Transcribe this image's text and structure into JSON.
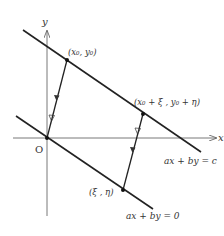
{
  "diagram": {
    "type": "geometry",
    "colors": {
      "line": "#222222",
      "axis": "#555555",
      "text": "#333333",
      "background": "#ffffff"
    },
    "axes": {
      "x_label": "x",
      "y_label": "y",
      "origin_label": "O"
    },
    "lines": [
      {
        "id": "upper",
        "equation": "ax + by = c"
      },
      {
        "id": "lower",
        "equation": "ax + by = 0"
      }
    ],
    "points": [
      {
        "id": "p0",
        "label": "(x₀, y₀)"
      },
      {
        "id": "p1",
        "label": "(x₀ + ξ , y₀ + η)"
      },
      {
        "id": "q",
        "label": "(ξ , η)"
      }
    ],
    "vectors": [
      {
        "from": "O",
        "to": "(x₀, y₀)"
      },
      {
        "from": "(ξ, η)",
        "to": "(x₀ + ξ, y₀ + η)"
      }
    ]
  }
}
